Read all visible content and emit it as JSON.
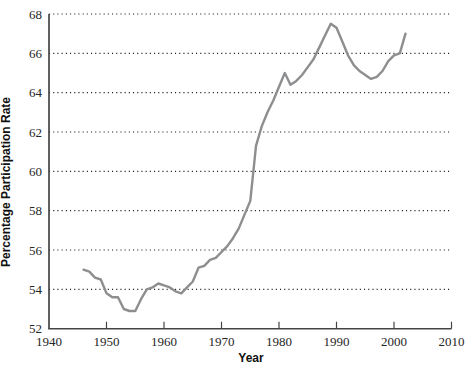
{
  "chart_data": {
    "type": "line",
    "title": "",
    "xlabel": "Year",
    "ylabel": "Percentage Participation Rate",
    "xlim": [
      1940,
      2010
    ],
    "ylim": [
      52,
      68
    ],
    "x_ticks": [
      1940,
      1950,
      1960,
      1970,
      1980,
      1990,
      2000,
      2010
    ],
    "y_ticks": [
      52,
      54,
      56,
      58,
      60,
      62,
      64,
      66,
      68
    ],
    "gridlines_y": [
      54,
      56,
      58,
      60,
      62,
      64,
      66,
      68
    ],
    "grid_style": "dotted",
    "legend_position": "none",
    "line_color": "#8d8e90",
    "axis_color": "#454545",
    "text_color": "#262626",
    "series": [
      {
        "name": "participation_rate",
        "x": [
          1946,
          1947,
          1948,
          1949,
          1950,
          1951,
          1952,
          1953,
          1954,
          1955,
          1956,
          1957,
          1958,
          1959,
          1960,
          1961,
          1962,
          1963,
          1964,
          1965,
          1966,
          1967,
          1968,
          1969,
          1970,
          1971,
          1972,
          1973,
          1974,
          1975,
          1976,
          1977,
          1978,
          1979,
          1980,
          1981,
          1982,
          1983,
          1984,
          1985,
          1986,
          1987,
          1988,
          1989,
          1990,
          1991,
          1992,
          1993,
          1994,
          1995,
          1996,
          1997,
          1998,
          1999,
          2000,
          2001,
          2002
        ],
        "y": [
          55.0,
          54.9,
          54.6,
          54.5,
          53.8,
          53.6,
          53.6,
          53.0,
          52.9,
          52.9,
          53.5,
          54.0,
          54.1,
          54.3,
          54.2,
          54.1,
          53.9,
          53.8,
          54.1,
          54.4,
          55.1,
          55.2,
          55.5,
          55.6,
          55.9,
          56.2,
          56.6,
          57.1,
          57.8,
          58.5,
          61.3,
          62.3,
          63.0,
          63.6,
          64.3,
          65.0,
          64.4,
          64.6,
          64.9,
          65.3,
          65.7,
          66.3,
          66.9,
          67.5,
          67.3,
          66.6,
          65.9,
          65.4,
          65.1,
          64.9,
          64.7,
          64.8,
          65.1,
          65.6,
          65.9,
          66.0,
          67.0
        ]
      }
    ]
  }
}
